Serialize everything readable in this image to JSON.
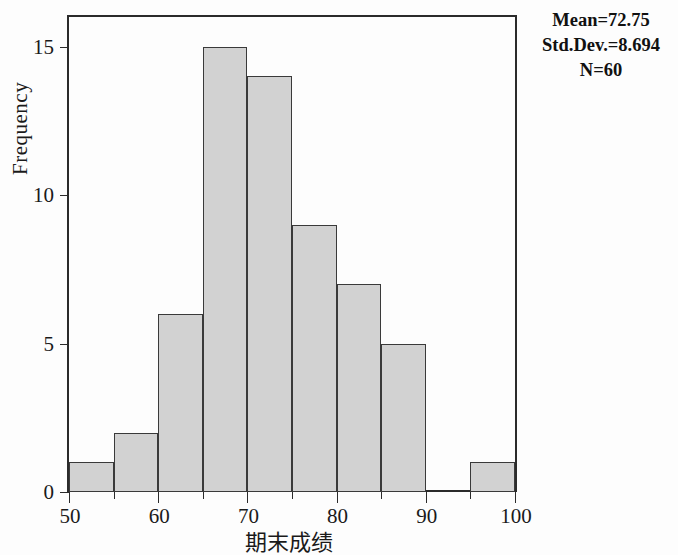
{
  "chart_data": {
    "type": "bar",
    "title": "",
    "xlabel": "期末成绩",
    "ylabel": "Frequency",
    "bin_width": 5,
    "categories": [
      "50-55",
      "55-60",
      "60-65",
      "65-70",
      "70-75",
      "75-80",
      "80-85",
      "85-90",
      "90-95",
      "95-100"
    ],
    "bin_starts": [
      50,
      55,
      60,
      65,
      70,
      75,
      80,
      85,
      90,
      95
    ],
    "values": [
      1,
      2,
      6,
      15,
      14,
      9,
      7,
      5,
      0,
      1
    ],
    "xlim": [
      50,
      100
    ],
    "ylim": [
      0,
      16
    ],
    "x_ticks_major": [
      50,
      60,
      70,
      80,
      90,
      100
    ],
    "x_ticks_minor": [
      55,
      65,
      75,
      85,
      95
    ],
    "y_ticks": [
      0,
      5,
      10,
      15
    ],
    "grid": false,
    "legend": "none",
    "bar_fill_color": "#d2d2d2",
    "bar_border_color": "#3a3a3a",
    "annotations": {
      "mean": "Mean=72.75",
      "std_dev": "Std.Dev.=8.694",
      "n": "N=60"
    }
  }
}
